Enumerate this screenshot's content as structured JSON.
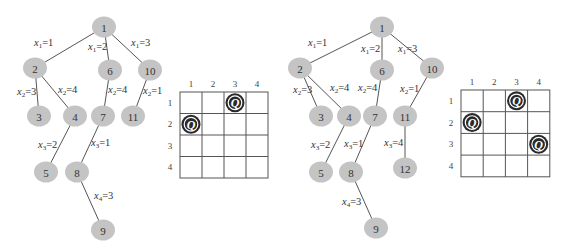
{
  "panels": [
    {
      "id": "left",
      "tree": {
        "nodes": [
          {
            "id": "1",
            "label": "1",
            "x": 104,
            "y": 27
          },
          {
            "id": "2",
            "label": "2",
            "x": 35,
            "y": 68
          },
          {
            "id": "6",
            "label": "6",
            "x": 110,
            "y": 70
          },
          {
            "id": "10",
            "label": "10",
            "x": 150,
            "y": 70
          },
          {
            "id": "3",
            "label": "3",
            "x": 39,
            "y": 116
          },
          {
            "id": "4",
            "label": "4",
            "x": 75,
            "y": 116
          },
          {
            "id": "7",
            "label": "7",
            "x": 103,
            "y": 116
          },
          {
            "id": "11",
            "label": "11",
            "x": 133,
            "y": 116
          },
          {
            "id": "5",
            "label": "5",
            "x": 46,
            "y": 172
          },
          {
            "id": "8",
            "label": "8",
            "x": 77,
            "y": 172
          },
          {
            "id": "9",
            "label": "9",
            "x": 103,
            "y": 230
          }
        ],
        "edges": [
          {
            "from": "1",
            "to": "2",
            "var": "x",
            "sub": "1",
            "val": "1",
            "lx": 34,
            "ly": 46
          },
          {
            "from": "1",
            "to": "6",
            "var": "x",
            "sub": "1",
            "val": "2",
            "lx": 88,
            "ly": 50
          },
          {
            "from": "1",
            "to": "10",
            "var": "x",
            "sub": "1",
            "val": "3",
            "lx": 131,
            "ly": 46
          },
          {
            "from": "2",
            "to": "3",
            "var": "x",
            "sub": "2",
            "val": "3",
            "lx": 17,
            "ly": 95
          },
          {
            "from": "2",
            "to": "4",
            "var": "x",
            "sub": "2",
            "val": "4",
            "lx": 58,
            "ly": 93
          },
          {
            "from": "6",
            "to": "7",
            "var": "x",
            "sub": "2",
            "val": "4",
            "lx": 108,
            "ly": 93
          },
          {
            "from": "10",
            "to": "11",
            "var": "x",
            "sub": "2",
            "val": "1",
            "lx": 143,
            "ly": 94
          },
          {
            "from": "4",
            "to": "5",
            "var": "x",
            "sub": "3",
            "val": "2",
            "lx": 38,
            "ly": 148
          },
          {
            "from": "7",
            "to": "8",
            "var": "x",
            "sub": "3",
            "val": "1",
            "lx": 91,
            "ly": 146
          },
          {
            "from": "8",
            "to": "9",
            "var": "x",
            "sub": "4",
            "val": "3",
            "lx": 94,
            "ly": 199
          }
        ]
      },
      "board": {
        "x": 180,
        "y": 92,
        "cell_w": 22,
        "cell_h": 21.5,
        "col_labels": [
          "1",
          "2",
          "3",
          "4"
        ],
        "row_labels": [
          "1",
          "2",
          "3",
          "4"
        ],
        "queen_symbol": "Q",
        "queens": [
          {
            "row": 1,
            "col": 3
          },
          {
            "row": 2,
            "col": 1
          }
        ]
      }
    },
    {
      "id": "right",
      "tree": {
        "nodes": [
          {
            "id": "1",
            "label": "1",
            "x": 382,
            "y": 27
          },
          {
            "id": "2",
            "label": "2",
            "x": 300,
            "y": 68
          },
          {
            "id": "6",
            "label": "6",
            "x": 382,
            "y": 70
          },
          {
            "id": "10",
            "label": "10",
            "x": 432,
            "y": 68
          },
          {
            "id": "3",
            "label": "3",
            "x": 321,
            "y": 116
          },
          {
            "id": "4",
            "label": "4",
            "x": 349,
            "y": 116
          },
          {
            "id": "7",
            "label": "7",
            "x": 375,
            "y": 116
          },
          {
            "id": "11",
            "label": "11",
            "x": 405,
            "y": 116
          },
          {
            "id": "5",
            "label": "5",
            "x": 321,
            "y": 172
          },
          {
            "id": "8",
            "label": "8",
            "x": 351,
            "y": 172
          },
          {
            "id": "12",
            "label": "12",
            "x": 405,
            "y": 168
          },
          {
            "id": "9",
            "label": "9",
            "x": 376,
            "y": 228
          }
        ],
        "edges": [
          {
            "from": "1",
            "to": "2",
            "var": "x",
            "sub": "1",
            "val": "1",
            "lx": 308,
            "ly": 46
          },
          {
            "from": "1",
            "to": "6",
            "var": "x",
            "sub": "1",
            "val": "2",
            "lx": 361,
            "ly": 52
          },
          {
            "from": "1",
            "to": "10",
            "var": "x",
            "sub": "1",
            "val": "3",
            "lx": 398,
            "ly": 52
          },
          {
            "from": "2",
            "to": "3",
            "var": "x",
            "sub": "2",
            "val": "3",
            "lx": 293,
            "ly": 93
          },
          {
            "from": "2",
            "to": "4",
            "var": "x",
            "sub": "2",
            "val": "4",
            "lx": 330,
            "ly": 91
          },
          {
            "from": "6",
            "to": "7",
            "var": "x",
            "sub": "2",
            "val": "4",
            "lx": 358,
            "ly": 91
          },
          {
            "from": "10",
            "to": "11",
            "var": "x",
            "sub": "2",
            "val": "1",
            "lx": 400,
            "ly": 92
          },
          {
            "from": "4",
            "to": "5",
            "var": "x",
            "sub": "3",
            "val": "2",
            "lx": 311,
            "ly": 148
          },
          {
            "from": "7",
            "to": "8",
            "var": "x",
            "sub": "3",
            "val": "1",
            "lx": 344,
            "ly": 147
          },
          {
            "from": "11",
            "to": "12",
            "var": "x",
            "sub": "3",
            "val": "4",
            "lx": 384,
            "ly": 146
          },
          {
            "from": "8",
            "to": "9",
            "var": "x",
            "sub": "4",
            "val": "3",
            "lx": 342,
            "ly": 205
          }
        ]
      },
      "board": {
        "x": 461,
        "y": 90,
        "cell_w": 22.2,
        "cell_h": 21.7,
        "col_labels": [
          "1",
          "2",
          "3",
          "4"
        ],
        "row_labels": [
          "1",
          "2",
          "3",
          "4"
        ],
        "queen_symbol": "Q",
        "queens": [
          {
            "row": 1,
            "col": 3
          },
          {
            "row": 2,
            "col": 1
          },
          {
            "row": 3,
            "col": 4
          }
        ]
      }
    }
  ]
}
